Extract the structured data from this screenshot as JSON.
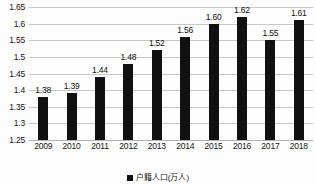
{
  "chart_data": {
    "type": "bar",
    "title": "",
    "subtitle": "",
    "xlabel": "",
    "ylabel": "",
    "categories": [
      "2009",
      "2010",
      "2011",
      "2012",
      "2013",
      "2014",
      "2015",
      "2016",
      "2017",
      "2018"
    ],
    "values": [
      1.38,
      1.39,
      1.44,
      1.48,
      1.52,
      1.56,
      1.6,
      1.62,
      1.55,
      1.61
    ],
    "data_labels": [
      "1.38",
      "1.39",
      "1.44",
      "1.48",
      "1.52",
      "1.56",
      "1.60",
      "1.62",
      "1.55",
      "1.61"
    ],
    "series": [
      {
        "name": "户籍人口(万人)",
        "values": [
          1.38,
          1.39,
          1.44,
          1.48,
          1.52,
          1.56,
          1.6,
          1.62,
          1.55,
          1.61
        ],
        "color": "#111111"
      }
    ],
    "ylim": [
      1.25,
      1.65
    ],
    "ytick_values": [
      1.25,
      1.3,
      1.35,
      1.4,
      1.45,
      1.5,
      1.55,
      1.6,
      1.65
    ],
    "ytick_labels": [
      "1.25",
      "1.3",
      "1.35",
      "1.4",
      "1.45",
      "1.5",
      "1.55",
      "1.6",
      "1.65"
    ],
    "grid": true,
    "grid_axis": "y",
    "legend_position": "bottom",
    "bar_color": "#111111",
    "grid_color": "#c8c8c8",
    "background_color": "#fdfdfd"
  },
  "legend": {
    "label": "户籍人口(万人)",
    "marker": "square-marker"
  }
}
